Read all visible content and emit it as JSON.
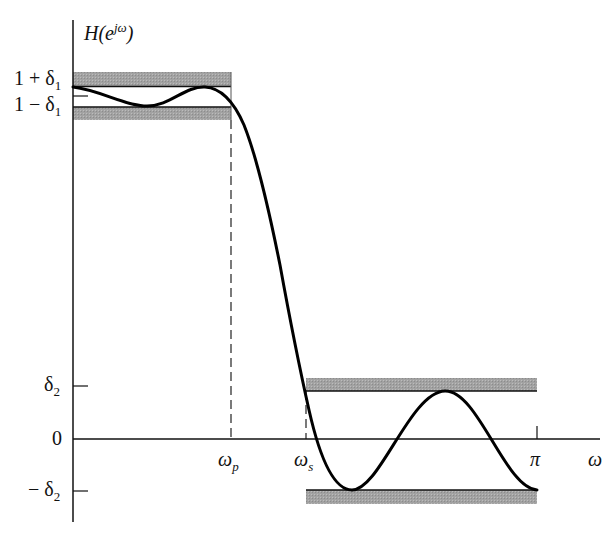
{
  "diagram": {
    "y_axis_label": "H(e^{jω})",
    "y_axis_label_parts": {
      "base": "H(e",
      "sup": "jω",
      "close": ")"
    },
    "x_axis_label": "ω",
    "y_ticks": [
      {
        "label": "1 + δ1",
        "main": "1 + δ",
        "sub": "1"
      },
      {
        "label": "1 − δ1",
        "main": "1 − δ",
        "sub": "1"
      },
      {
        "label": "δ2",
        "main": "δ",
        "sub": "2"
      },
      {
        "label": "0",
        "main": "0",
        "sub": ""
      },
      {
        "label": "−δ2",
        "main": "− δ",
        "sub": "2"
      }
    ],
    "x_ticks": [
      {
        "label": "ωp",
        "main": "ω",
        "sub": "p"
      },
      {
        "label": "ωs",
        "main": "ω",
        "sub": "s"
      },
      {
        "label": "π",
        "main": "π",
        "sub": ""
      }
    ],
    "regions": [
      {
        "name": "passband",
        "from": "0",
        "to": "ωp",
        "upper": "1 + δ1",
        "lower": "1 − δ1"
      },
      {
        "name": "transition band",
        "from": "ωp",
        "to": "ωs"
      },
      {
        "name": "stopband",
        "from": "ωs",
        "to": "π",
        "upper": "δ2",
        "lower": "−δ2"
      }
    ],
    "colors": {
      "band": "#9a9a9a",
      "curve": "#000000",
      "axis": "#111111"
    }
  }
}
